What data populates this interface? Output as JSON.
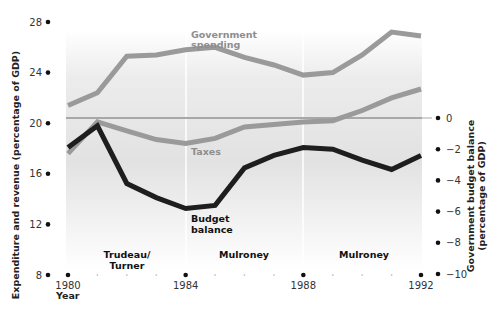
{
  "chart_data": {
    "type": "line",
    "title": "",
    "xlabel": "Year",
    "ylabel": "Expenditure and revenue (percentage of GDP)",
    "y2label": "Government budget balance (percentage of GDP)",
    "x": [
      1980,
      1981,
      1982,
      1983,
      1984,
      1985,
      1986,
      1987,
      1988,
      1989,
      1990,
      1991,
      1992
    ],
    "xlim": [
      1980,
      1992
    ],
    "ylim": [
      8,
      28
    ],
    "y2lim": [
      -10,
      0
    ],
    "x_ticks": [
      "1980",
      "1984",
      "1988",
      "1992"
    ],
    "y_ticks": [
      "28",
      "24",
      "20",
      "16",
      "12",
      "8"
    ],
    "y2_ticks": [
      "0",
      "−2",
      "−4",
      "−6",
      "−8",
      "−10"
    ],
    "grid": false,
    "series": [
      {
        "name": "Government spending",
        "axis": "left",
        "color": "#9a9a9a",
        "values": [
          21.4,
          22.4,
          25.3,
          25.4,
          25.8,
          26.0,
          25.2,
          24.6,
          23.8,
          24.0,
          25.4,
          27.2,
          26.9
        ]
      },
      {
        "name": "Taxes",
        "axis": "left",
        "color": "#9a9a9a",
        "values": [
          17.6,
          20.1,
          19.4,
          18.7,
          18.4,
          18.8,
          19.7,
          19.9,
          20.1,
          20.2,
          21.0,
          22.0,
          22.7
        ]
      },
      {
        "name": "Budget balance",
        "axis": "right",
        "color": "#1e1e1e",
        "values": [
          -1.9,
          -0.5,
          -4.2,
          -5.1,
          -5.8,
          -5.6,
          -3.2,
          -2.4,
          -1.9,
          -2.0,
          -2.7,
          -3.3,
          -2.4
        ]
      }
    ],
    "annotations": [
      {
        "text": "Trudeau/ Turner",
        "span": [
          1980,
          1984
        ]
      },
      {
        "text": "Mulroney",
        "span": [
          1984,
          1988
        ]
      },
      {
        "text": "Mulroney",
        "span": [
          1988,
          1992
        ]
      }
    ],
    "legend": "inline labels"
  },
  "labels": {
    "gov_spending_1": "Government",
    "gov_spending_2": "spending",
    "taxes": "Taxes",
    "budget_1": "Budget",
    "budget_2": "balance",
    "era1_1": "Trudeau/",
    "era1_2": "Turner",
    "era2": "Mulroney",
    "era3": "Mulroney",
    "x_title": "Year",
    "y_title": "Expenditure and revenue (percentage of GDP)",
    "y2_title_1": "Government budget balance",
    "y2_title_2": "(percentage of GDP)"
  }
}
